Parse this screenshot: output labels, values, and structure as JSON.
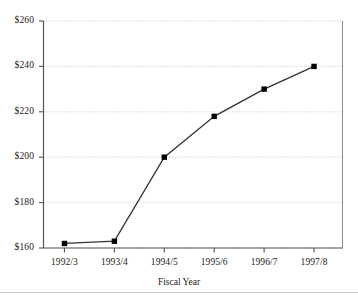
{
  "chart_data": {
    "type": "line",
    "title": "",
    "subtitle": "",
    "xlabel": "Fiscal Year",
    "ylabel": "",
    "categories": [
      "1992/3",
      "1993/4",
      "1994/5",
      "1995/6",
      "1996/7",
      "1997/8"
    ],
    "series": [
      {
        "name": "Value",
        "values": [
          162,
          163,
          200,
          218,
          230,
          240
        ]
      }
    ],
    "ylim": [
      160,
      260
    ],
    "yticks": [
      160,
      180,
      200,
      220,
      240,
      260
    ],
    "ytick_labels": [
      "$160",
      "$180",
      "$200",
      "$220",
      "$240",
      "$260"
    ],
    "xtick_labels": [
      "1992/3",
      "1993/4",
      "1994/5",
      "1995/6",
      "1996/7",
      "1997/8"
    ],
    "grid": true,
    "grid_style": "dotted",
    "legend": false,
    "legend_position": "none",
    "marker": "square",
    "line_color": "#333333",
    "marker_color": "#000000",
    "grid_color": "#bdbdbd",
    "axis_color": "#555555",
    "background_color": "#ffffff",
    "annotations": []
  },
  "axis": {
    "x_title": "Fiscal Year"
  }
}
